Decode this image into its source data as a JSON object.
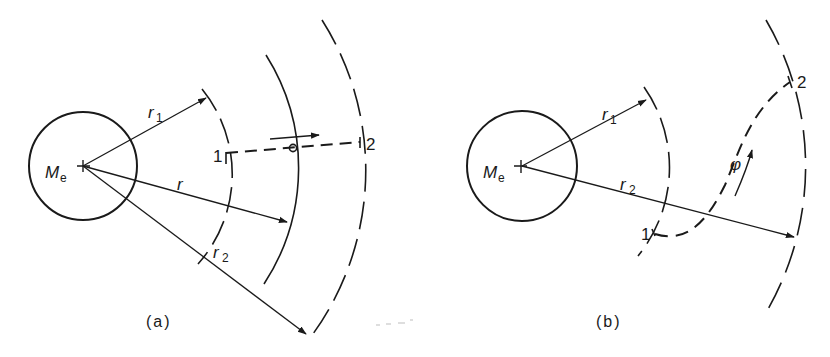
{
  "figure": {
    "panels": [
      {
        "id": "a",
        "caption": "(a)",
        "mass_label": "M",
        "mass_subscript": "e",
        "radius_labels": {
          "r1": {
            "base": "r",
            "sub": "1"
          },
          "r": {
            "base": "r",
            "sub": ""
          },
          "r2": {
            "base": "r",
            "sub": "2"
          }
        },
        "point_labels": {
          "start": "1",
          "end": "2"
        },
        "path_description": "straight radial dashed path from orbit 1 to orbit 2 with moving particle and direction arrow",
        "orbits": [
          "r1 (dashed)",
          "r (solid)",
          "r2 (dashed)"
        ]
      },
      {
        "id": "b",
        "caption": "(b)",
        "mass_label": "M",
        "mass_subscript": "e",
        "radius_labels": {
          "r1": {
            "base": "r",
            "sub": "1"
          },
          "r2": {
            "base": "r",
            "sub": "2"
          }
        },
        "point_labels": {
          "start": "1",
          "end": "2"
        },
        "angle_label": "φ",
        "path_description": "curved dashed transfer path from orbit 1 to orbit 2 with direction arrow",
        "orbits": [
          "r1 (dashed)",
          "r2 (dashed)"
        ]
      }
    ],
    "colors": {
      "ink": "#1a1a1a",
      "background": "#ffffff"
    }
  }
}
